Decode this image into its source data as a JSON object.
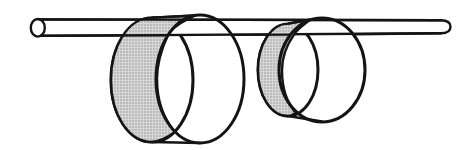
{
  "figure": {
    "canvas": {
      "width": 460,
      "height": 150
    },
    "colors": {
      "background": "#ffffff",
      "ink": "#141414",
      "shade_base": "#d7d7d7",
      "shade_dot": "#8f8f8f"
    },
    "stroke": {
      "rim": 3,
      "rod": 2.4,
      "line": 2.4
    },
    "rod": {
      "body_path": "M 39 19.4 L 441 20.3 C 448 20.4 450.5 22.8 450.5 26.8 C 450.5 30.9 448 33.2 441 33.2 L 39 35.9 Z",
      "top_line": [
        39,
        19.4,
        441,
        20.3
      ],
      "bottom_line_segments": [
        [
          41,
          35.8,
          168,
          35.2
        ],
        [
          232,
          34.9,
          290,
          34.6
        ],
        [
          354,
          34.2,
          441,
          33.2
        ]
      ],
      "end_cap_ellipse": {
        "cx": 37.8,
        "cy": 27.8,
        "rx": 7.0,
        "ry": 8.8
      }
    },
    "rings": [
      {
        "id": "large-ring",
        "back_rim": {
          "cx": 152,
          "cy": 80,
          "rx": 41,
          "ry": 62
        },
        "front_rim": {
          "cx": 200,
          "cy": 79,
          "rx": 44,
          "ry": 64
        },
        "inner_shade_path": "M 152 17.6 L 195 15.5 C 186 20 173 26 168 35 C 161 50 157 63 157 79 C 157 100 163 118 175 132 C 165 139 158 141.8 152 142 C 128 142 111 114 111 80 C 111 46 128 17.6 152 17.6 Z",
        "top_tangent": [
          152,
          17.6,
          195,
          15.5
        ],
        "bottom_tangent": [
          152,
          142,
          200,
          143
        ]
      },
      {
        "id": "small-ring",
        "back_rim": {
          "cx": 288,
          "cy": 70,
          "rx": 30,
          "ry": 46
        },
        "front_rim": {
          "cx": 322,
          "cy": 70,
          "rx": 43,
          "ry": 52
        },
        "inner_shade_path": "M 288 23.6 L 310 19.8 C 304 24.5 297 29 294 34.6 C 286 46 282 57 282 70 C 282 88 287 103 296 113 C 291 115.5 289.5 116 288 116 C 271 116 258 95.5 258 70 C 258 44.5 271 23.6 288 23.6 Z",
        "top_tangent": [
          288,
          23.6,
          310,
          19.8
        ],
        "bottom_tangent": [
          288,
          116,
          322,
          121.5
        ]
      }
    ]
  }
}
